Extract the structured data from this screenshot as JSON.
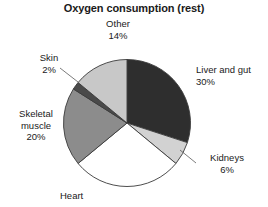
{
  "chart_data": {
    "type": "pie",
    "title": "Oxygen consumption (rest)",
    "xlabel": "",
    "ylabel": "",
    "legend_position": "none",
    "grid": false,
    "labels_outside": true,
    "categories": [
      "Liver and gut",
      "Kidneys",
      "Heart",
      "Skeletal muscle",
      "Skin",
      "Other"
    ],
    "values": [
      30,
      6,
      28,
      20,
      2,
      14
    ],
    "value_unit": "%",
    "slices": [
      {
        "name": "Liver and gut",
        "value": 30,
        "value_text": "30%",
        "color": "#2e2e2e",
        "start_angle_deg": 0,
        "end_angle_deg": 108
      },
      {
        "name": "Kidneys",
        "value": 6,
        "value_text": "6%",
        "color": "#d2d2d2",
        "start_angle_deg": 108,
        "end_angle_deg": 129.6
      },
      {
        "name": "Heart",
        "value": 28,
        "value_text": "",
        "color": "#ffffff",
        "start_angle_deg": 129.6,
        "end_angle_deg": 230.4
      },
      {
        "name": "Skeletal muscle",
        "value": 20,
        "value_text": "20%",
        "color": "#8c8c8c",
        "start_angle_deg": 230.4,
        "end_angle_deg": 302.4
      },
      {
        "name": "Skin",
        "value": 2,
        "value_text": "2%",
        "color": "#4a4a4a",
        "start_angle_deg": 302.4,
        "end_angle_deg": 309.6
      },
      {
        "name": "Other",
        "value": 14,
        "value_text": "14%",
        "color": "#c8c8c8",
        "start_angle_deg": 309.6,
        "end_angle_deg": 360
      }
    ]
  },
  "chart": {
    "title": "Oxygen consumption (rest)",
    "labels": {
      "other": {
        "name": "Other",
        "pct": "14%"
      },
      "liver": {
        "name": "Liver and gut",
        "pct": "30%"
      },
      "kidneys": {
        "name": "Kidneys",
        "pct": "6%"
      },
      "heart": {
        "name": "Heart",
        "pct": ""
      },
      "skeletal": {
        "name": "Skeletal",
        "name2": "muscle",
        "pct": "20%"
      },
      "skin": {
        "name": "Skin",
        "pct": "2%"
      }
    }
  }
}
